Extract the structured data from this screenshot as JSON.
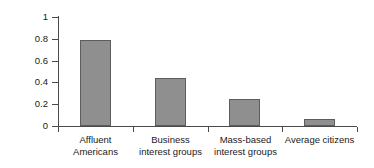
{
  "chart_data": {
    "type": "bar",
    "title": "",
    "xlabel": "",
    "ylabel": "Influence on Policy",
    "categories": [
      "Affluent\nAmericans",
      "Business\ninterest groups",
      "Mass-based\ninterest groups",
      "Average citizens"
    ],
    "category_lines": [
      [
        "Affluent",
        "Americans"
      ],
      [
        "Business",
        "interest groups"
      ],
      [
        "Mass-based",
        "interest groups"
      ],
      [
        "Average citizens",
        ""
      ]
    ],
    "values": [
      0.79,
      0.44,
      0.25,
      0.06
    ],
    "ylim": [
      0,
      1
    ],
    "ytick_labels": [
      "0",
      "0.2",
      "0.4",
      "0.6",
      "0.8",
      "1"
    ],
    "ytick_values": [
      0,
      0.2,
      0.4,
      0.6,
      0.8,
      1
    ],
    "grid": false,
    "legend": false,
    "bar_color": "#8f8f8f",
    "bar_border_color": "#5d5d5d",
    "axis_color": "#4a4a4a",
    "background_color": "#ffffff"
  }
}
